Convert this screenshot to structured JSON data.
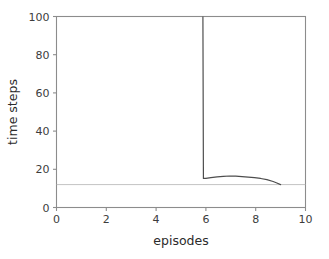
{
  "chart_data": {
    "type": "line",
    "title": "",
    "xlabel": "episodes",
    "ylabel": "time steps",
    "xlim": [
      0,
      10
    ],
    "ylim": [
      0,
      100
    ],
    "xticks": [
      0,
      2,
      4,
      6,
      8,
      10
    ],
    "yticks": [
      0,
      20,
      40,
      60,
      80,
      100
    ],
    "xticklabels": [
      "0",
      "2",
      "4",
      "6",
      "8",
      "10"
    ],
    "yticklabels": [
      "0",
      "20",
      "40",
      "60",
      "80",
      "100"
    ],
    "grid": false,
    "legend": null,
    "series": [
      {
        "name": "time steps per episode",
        "color": "#4d4d4d",
        "linewidth": 1.2,
        "x": [
          5.88,
          5.9,
          6.0,
          6.2,
          6.45,
          6.7,
          6.95,
          7.2,
          7.45,
          7.7,
          7.95,
          8.2,
          8.45,
          8.7,
          8.85,
          9.0
        ],
        "values": [
          100,
          15.2,
          15.3,
          15.6,
          16.0,
          16.3,
          16.5,
          16.4,
          16.2,
          15.9,
          15.6,
          15.2,
          14.6,
          13.6,
          12.8,
          12.0
        ]
      }
    ],
    "reference_lines": [
      {
        "name": "baseline",
        "orientation": "horizontal",
        "value": 12,
        "color": "#b5b5b5",
        "linewidth": 0.8
      }
    ],
    "axes_color": "#8c8c8c",
    "background": "#ffffff"
  }
}
